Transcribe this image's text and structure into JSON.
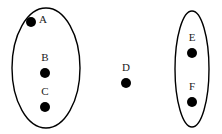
{
  "diagram": {
    "type": "venn-like-point-grouping",
    "canvas": {
      "width": 222,
      "height": 134
    },
    "colors": {
      "background": "#ffffff",
      "stroke": "#000000",
      "dot_fill": "#000000",
      "label_text": "#1a1a1a"
    },
    "groups": [
      {
        "id": "left-group",
        "shape": "ellipse",
        "cx": 46,
        "cy": 68,
        "rx": 34,
        "ry": 60,
        "members": [
          "A",
          "B",
          "C"
        ]
      },
      {
        "id": "right-group",
        "shape": "ellipse",
        "cx": 192,
        "cy": 69,
        "rx": 17,
        "ry": 58,
        "members": [
          "E",
          "F"
        ]
      }
    ],
    "nodes": [
      {
        "id": "node-a",
        "label": "A",
        "dot": {
          "cx": 31,
          "cy": 22,
          "r": 5
        },
        "label_pos": {
          "x": 43,
          "y": 20
        },
        "group": "left-group"
      },
      {
        "id": "node-b",
        "label": "B",
        "dot": {
          "cx": 45,
          "cy": 73,
          "r": 5
        },
        "label_pos": {
          "x": 45,
          "y": 58
        },
        "group": "left-group"
      },
      {
        "id": "node-c",
        "label": "C",
        "dot": {
          "cx": 45,
          "cy": 107,
          "r": 5
        },
        "label_pos": {
          "x": 45,
          "y": 92
        },
        "group": "left-group"
      },
      {
        "id": "node-d",
        "label": "D",
        "dot": {
          "cx": 126,
          "cy": 83,
          "r": 5
        },
        "label_pos": {
          "x": 126,
          "y": 68
        },
        "group": null
      },
      {
        "id": "node-e",
        "label": "E",
        "dot": {
          "cx": 192,
          "cy": 53,
          "r": 5
        },
        "label_pos": {
          "x": 192,
          "y": 38
        },
        "group": "right-group"
      },
      {
        "id": "node-f",
        "label": "F",
        "dot": {
          "cx": 192,
          "cy": 102,
          "r": 5
        },
        "label_pos": {
          "x": 192,
          "y": 87
        },
        "group": "right-group"
      }
    ]
  }
}
